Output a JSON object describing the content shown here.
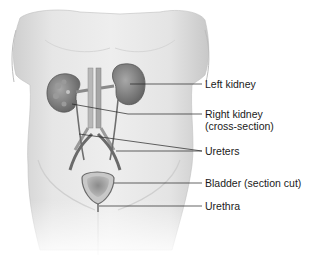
{
  "figure": {
    "labels": [
      {
        "id": "left-kidney",
        "lines": [
          "Left kidney"
        ],
        "top": 79
      },
      {
        "id": "right-kidney",
        "lines": [
          "Right kidney",
          "(cross-section)"
        ],
        "top": 108
      },
      {
        "id": "ureters",
        "lines": [
          "Ureters"
        ],
        "top": 146
      },
      {
        "id": "bladder",
        "lines": [
          "Bladder (section cut)"
        ],
        "top": 177
      },
      {
        "id": "urethra",
        "lines": [
          "Urethra"
        ],
        "top": 200
      }
    ]
  },
  "colors": {
    "skin_light": "#e8e8e8",
    "skin_mid": "#cfcfcf",
    "organ_dark": "#7a7a7a",
    "leader_line": "#222222",
    "text": "#1a1a1a"
  }
}
